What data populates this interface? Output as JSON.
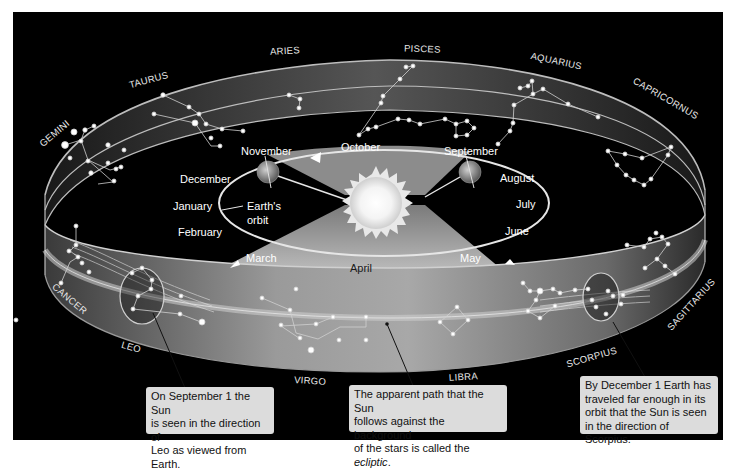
{
  "diagram": {
    "center_label": "Earth's orbit",
    "center_label_lines": [
      "Earth's",
      "orbit"
    ],
    "months": {
      "october": "October",
      "november": "November",
      "december": "December",
      "january": "January",
      "february": "February",
      "march": "March",
      "april": "April",
      "may": "May",
      "june": "June",
      "july": "July",
      "august": "August",
      "september": "September"
    },
    "constellations": {
      "aries": "ARIES",
      "pisces": "PISCES",
      "aquarius": "AQUARIUS",
      "capricornus": "CAPRICORNUS",
      "taurus": "TAURUS",
      "gemini": "GEMINI",
      "cancer": "CANCER",
      "leo": "LEO",
      "virgo": "VIRGO",
      "libra": "LIBRA",
      "scorpius": "SCORPIUS",
      "sagittarius": "SAGITTARIUS"
    },
    "callouts": {
      "leo": {
        "line1": "On September 1 the Sun",
        "line2": "is seen in the direction of",
        "line3": "Leo as viewed from Earth."
      },
      "ecliptic": {
        "line1": "The apparent path that the Sun",
        "line2": "follows against the background",
        "line3_prefix": "of the stars is called the ",
        "line3_em": "ecliptic",
        "line3_suffix": "."
      },
      "scorpius": {
        "line1": "By December 1 Earth has",
        "line2": "traveled far enough in its",
        "line3": "orbit that the Sun is seen",
        "line4": "in the direction of Scorpius."
      }
    },
    "icons": [
      "sun-icon",
      "earth-icon"
    ],
    "colors": {
      "background": "#000000",
      "ring": "#8a8a8a",
      "ecliptic_band": "#c8c8c8",
      "callout_fill": "#dcdcdc",
      "text_light": "#ffffff",
      "text_dark": "#111111"
    }
  }
}
